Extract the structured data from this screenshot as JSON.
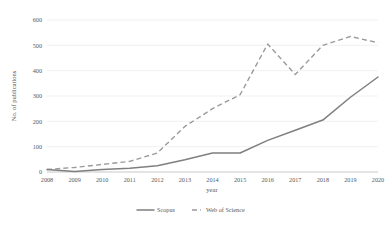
{
  "chart_data": {
    "type": "line",
    "title": "",
    "xlabel": "year",
    "ylabel": "No. of publications",
    "categories": [
      "2008",
      "2009",
      "2010",
      "2011",
      "2012",
      "2013",
      "2014",
      "2015",
      "2016",
      "2017",
      "2018",
      "2019",
      "2020"
    ],
    "x": [
      2008,
      2009,
      2010,
      2011,
      2012,
      2013,
      2014,
      2015,
      2016,
      2017,
      2018,
      2019,
      2020
    ],
    "xlim": [
      2008,
      2020
    ],
    "ylim": [
      0,
      600
    ],
    "yticks": [
      0,
      100,
      200,
      300,
      400,
      500,
      600
    ],
    "ytick_labels": [
      "0",
      "100",
      "200",
      "300",
      "400",
      "500",
      "600"
    ],
    "grid": "horizontal",
    "legend_position": "bottom",
    "series": [
      {
        "name": "Scopus",
        "style": "solid",
        "color": "#7f7f7f",
        "values": [
          10,
          2,
          10,
          15,
          25,
          48,
          75,
          75,
          125,
          165,
          205,
          295,
          375
        ]
      },
      {
        "name": "Web of Science",
        "style": "dashed",
        "color": "#9a9a9a",
        "values": [
          10,
          18,
          30,
          42,
          75,
          180,
          250,
          305,
          505,
          385,
          500,
          535,
          510
        ]
      }
    ]
  },
  "legend": {
    "items": [
      {
        "label": "Scopus",
        "style": "solid"
      },
      {
        "label": "Web of Science",
        "style": "dashed"
      }
    ]
  }
}
